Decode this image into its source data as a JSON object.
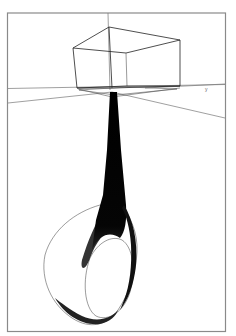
{
  "figure": {
    "axis_label_right": "y",
    "colors": {
      "background": "#ffffff",
      "lines": "#222222",
      "frame": "#8a8a8a"
    }
  }
}
